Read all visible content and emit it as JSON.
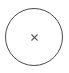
{
  "close_button": {
    "icon": "close-icon",
    "glyph": "×",
    "stroke_color": "#4a4a4a",
    "background": "#ffffff"
  }
}
